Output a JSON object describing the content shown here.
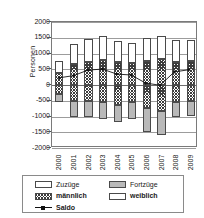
{
  "chart_data": {
    "type": "bar",
    "title": "",
    "subtitle": "",
    "xlabel": "",
    "ylabel": "Personen",
    "categories": [
      "2000",
      "2001",
      "2002",
      "2003",
      "2004",
      "2005",
      "2006",
      "2007",
      "2008",
      "2009"
    ],
    "ylim": [
      -2000,
      2000
    ],
    "ytick_labels": [
      "2000",
      "1500",
      "1000",
      "500",
      "0",
      "-500",
      "-1000",
      "-1500",
      "-2000"
    ],
    "ytick_values": [
      2000,
      1500,
      1000,
      500,
      0,
      -500,
      -1000,
      -1500,
      -2000
    ],
    "grid": true,
    "legend_position": "bottom",
    "stacked": true,
    "series": [
      {
        "name": "Zuzüge männlich",
        "group": "Zuzüge",
        "sex": "männlich",
        "fill": "hatch",
        "values": [
          380,
          680,
          720,
          800,
          720,
          700,
          760,
          820,
          740,
          750
        ]
      },
      {
        "name": "Zuzüge weiblich",
        "group": "Zuzüge",
        "sex": "weiblich",
        "fill": "white",
        "values": [
          370,
          620,
          730,
          750,
          680,
          630,
          740,
          740,
          680,
          680
        ]
      },
      {
        "name": "Fortzüge männlich",
        "group": "Fortzüge",
        "sex": "männlich",
        "fill": "hatch",
        "values": [
          -280,
          -500,
          -500,
          -540,
          -620,
          -530,
          -740,
          -830,
          -530,
          -500
        ]
      },
      {
        "name": "Fortzüge weiblich",
        "group": "Fortzüge",
        "sex": "weiblich",
        "fill": "gray",
        "values": [
          -270,
          -530,
          -520,
          -530,
          -560,
          -540,
          -750,
          -770,
          -500,
          -480
        ]
      },
      {
        "name": "Saldo",
        "type": "line",
        "marker": "filled-diamond",
        "values": [
          200,
          270,
          450,
          480,
          320,
          290,
          30,
          -40,
          390,
          460
        ]
      }
    ],
    "totals": {
      "Zuzüge": [
        750,
        1300,
        1450,
        1550,
        1400,
        1330,
        1500,
        1560,
        1420,
        1430
      ],
      "Fortzüge": [
        -550,
        -1030,
        -1020,
        -1070,
        -1180,
        -1070,
        -1490,
        -1600,
        -1030,
        -980
      ]
    }
  },
  "legend": {
    "entries": [
      {
        "label": "Zuzüge",
        "swatch": "white-box-icon"
      },
      {
        "label": "Fortzüge",
        "swatch": "gray-box-icon"
      },
      {
        "label": "männlich",
        "swatch": "hatched-box-icon"
      },
      {
        "label": "weiblich",
        "swatch": "white-box-icon"
      },
      {
        "label": "Saldo",
        "swatch": "line-marker-icon"
      }
    ]
  },
  "colors": {
    "hatch": "#3c3c3c",
    "gray_fill": "#b9b9b9",
    "white_fill": "#ffffff",
    "line": "#111111",
    "axis": "#7a7a7a",
    "grid": "#9c9c9c"
  }
}
